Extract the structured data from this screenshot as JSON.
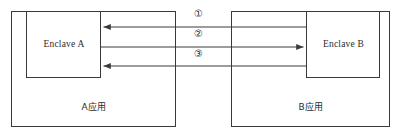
{
  "diagram": {
    "kind": "enclave-communication-flow",
    "stroke_color": "#3a3a3a",
    "text_color": "#2b2b2b",
    "background_color": "#ffffff",
    "containers": [
      {
        "id": "app-a",
        "label": "A应用",
        "x": 11,
        "y": 11,
        "width": 165,
        "height": 116
      },
      {
        "id": "app-b",
        "label": "B应用",
        "x": 231,
        "y": 11,
        "width": 159,
        "height": 116
      }
    ],
    "enclaves": [
      {
        "id": "enclave-a",
        "label": "Enclave A",
        "x": 26,
        "y": 11,
        "width": 75,
        "height": 67
      },
      {
        "id": "enclave-b",
        "label": "Enclave B",
        "x": 306,
        "y": 11,
        "width": 74,
        "height": 67
      }
    ],
    "flows": [
      {
        "id": "flow-1",
        "label": "①",
        "y": 27,
        "from_x": 306,
        "to_x": 101,
        "direction": "right-to-left",
        "arrowhead": "left"
      },
      {
        "id": "flow-2",
        "label": "②",
        "y": 47,
        "from_x": 101,
        "to_x": 306,
        "direction": "left-to-right",
        "arrowhead": "right"
      },
      {
        "id": "flow-3",
        "label": "③",
        "y": 66,
        "from_x": 306,
        "to_x": 101,
        "direction": "right-to-left",
        "arrowhead": "left"
      }
    ],
    "step_labels": {
      "step_1": "①",
      "step_2": "②",
      "step_3": "③"
    }
  }
}
